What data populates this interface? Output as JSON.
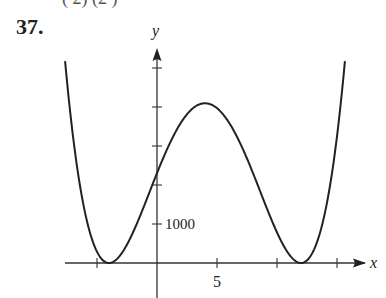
{
  "problem": {
    "number": "37.",
    "top_fragment": "(    2)        (2      )"
  },
  "chart_data": {
    "type": "line",
    "title": "",
    "xlabel": "x",
    "ylabel": "y",
    "x_tick_labels": [
      {
        "x": 5,
        "label": "5"
      }
    ],
    "y_tick_labels": [
      {
        "y": 1000,
        "label": "1000"
      }
    ],
    "x_ticks": [
      -5,
      0,
      5,
      10,
      15
    ],
    "y_ticks": [
      1000,
      2000,
      3000,
      4000,
      5000
    ],
    "xlim": [
      -8.5,
      18.5
    ],
    "ylim": [
      -800,
      5500
    ],
    "grid": false,
    "legend": null,
    "series": [
      {
        "name": "f(x) ≈ (x+4)^2 (x-12)^2",
        "x": [
          -7.66,
          -7,
          -6,
          -5,
          -4,
          -3,
          -2,
          -1,
          0,
          1,
          2,
          3,
          4,
          5,
          6,
          7,
          8,
          9,
          10,
          11,
          12,
          13,
          14,
          15,
          15.66
        ],
        "y": [
          5184,
          3249,
          1296,
          289,
          0,
          225,
          784,
          1521,
          2304,
          3025,
          3600,
          3969,
          4096,
          3969,
          3600,
          3025,
          2304,
          1521,
          784,
          225,
          0,
          289,
          1296,
          3249,
          5184
        ]
      }
    ],
    "annotations": {
      "local_minima": [
        [
          -4,
          0
        ],
        [
          12,
          0
        ]
      ],
      "local_maximum": [
        4,
        4096
      ],
      "y_intercept": [
        0,
        2304
      ]
    }
  }
}
